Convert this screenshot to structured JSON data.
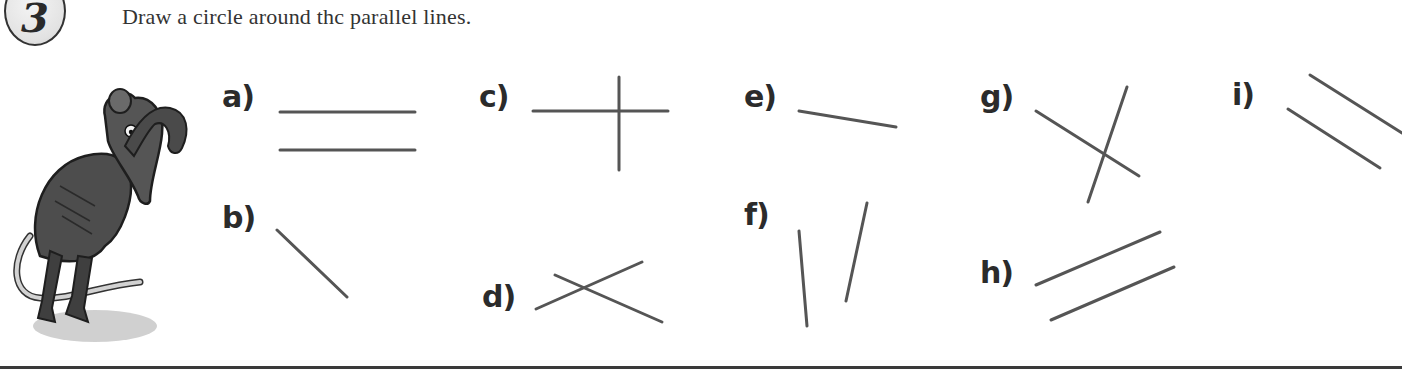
{
  "exercise": {
    "number": "3",
    "instruction": "Draw a circle around thc parallel lines."
  },
  "illustration": {
    "subject": "mouse-scratching-head",
    "colors": {
      "body": "#4a4a4a",
      "tail": "#cfcfcf",
      "shadow": "#bdbdbd"
    }
  },
  "style": {
    "line_color": "#555555",
    "line_width": 3,
    "label_color": "#2b2b2b",
    "rule_color": "#3a3a3a"
  },
  "items": [
    {
      "id": "a",
      "label": "a)",
      "label_pos": [
        222,
        82
      ],
      "parallel": true,
      "lines": [
        [
          280,
          112,
          415,
          112
        ],
        [
          280,
          150,
          415,
          150
        ]
      ]
    },
    {
      "id": "b",
      "label": "b)",
      "label_pos": [
        222,
        203
      ],
      "parallel": false,
      "lines": [
        [
          277,
          230,
          347,
          297
        ]
      ]
    },
    {
      "id": "c",
      "label": "c)",
      "label_pos": [
        479,
        82
      ],
      "parallel": false,
      "lines": [
        [
          533,
          111,
          668,
          111
        ],
        [
          619,
          77,
          619,
          170
        ]
      ]
    },
    {
      "id": "d",
      "label": "d)",
      "label_pos": [
        482,
        282
      ],
      "parallel": false,
      "lines": [
        [
          536,
          309,
          642,
          262
        ],
        [
          555,
          275,
          662,
          322
        ]
      ]
    },
    {
      "id": "e",
      "label": "e)",
      "label_pos": [
        744,
        82
      ],
      "parallel": false,
      "lines": [
        [
          799,
          111,
          896,
          127
        ]
      ]
    },
    {
      "id": "f",
      "label": "f)",
      "label_pos": [
        744,
        200
      ],
      "parallel": false,
      "lines": [
        [
          799,
          231,
          807,
          326
        ],
        [
          867,
          203,
          846,
          301
        ]
      ]
    },
    {
      "id": "g",
      "label": "g)",
      "label_pos": [
        980,
        82
      ],
      "parallel": false,
      "lines": [
        [
          1036,
          111,
          1139,
          176
        ],
        [
          1127,
          87,
          1088,
          202
        ]
      ]
    },
    {
      "id": "h",
      "label": "h)",
      "label_pos": [
        980,
        258
      ],
      "parallel": true,
      "lines": [
        [
          1036,
          285,
          1160,
          232
        ],
        [
          1051,
          320,
          1174,
          267
        ]
      ]
    },
    {
      "id": "i",
      "label": "i)",
      "label_pos": [
        1232,
        80
      ],
      "parallel": true,
      "lines": [
        [
          1310,
          75,
          1402,
          133
        ],
        [
          1288,
          109,
          1380,
          168
        ]
      ]
    }
  ]
}
